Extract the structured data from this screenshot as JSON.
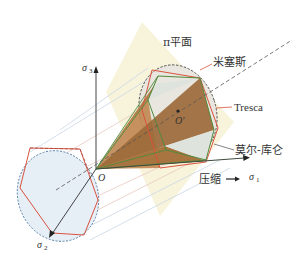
{
  "diagram": {
    "title": "",
    "labels": {
      "pi_plane": "π平面",
      "von_mises": "米塞斯",
      "tresca": "Tresca",
      "mohr_coulomb": "莫尔-库仑",
      "compression": "压缩",
      "compression_arrow": "→",
      "origin": "O",
      "origin_prime": "O′",
      "sigma": "σ",
      "sigma1_sub": "1",
      "sigma2_sub": "2",
      "sigma3_sub": "3"
    },
    "axes": [
      {
        "name": "σ1",
        "direction": "right"
      },
      {
        "name": "σ2",
        "direction": "down-left"
      },
      {
        "name": "σ3",
        "direction": "up"
      }
    ],
    "surfaces": [
      {
        "name": "米塞斯",
        "shape": "circular cone / cylinder",
        "style": "dashed dark outline"
      },
      {
        "name": "Tresca",
        "shape": "regular hexagon",
        "style": "red"
      },
      {
        "name": "莫尔-库仑",
        "shape": "irregular hexagonal pyramid",
        "style": "green / brown fill"
      }
    ],
    "colors": {
      "pi_plane_fill": "#f7f2d6",
      "cone_fill": "#b07a45",
      "cone_dark": "#8c5a2e",
      "inner_face": "#dfe3dd",
      "left_disc": "#e6eef6",
      "tresca": "#d9533f",
      "mohr": "#4f8a3c",
      "mises_dash": "#555555",
      "left_dash_blue": "#5b7fa8",
      "axis": "#444444",
      "guide_lines": "#e7c9c0",
      "guide_lines_blue": "#c9d6e4"
    }
  }
}
